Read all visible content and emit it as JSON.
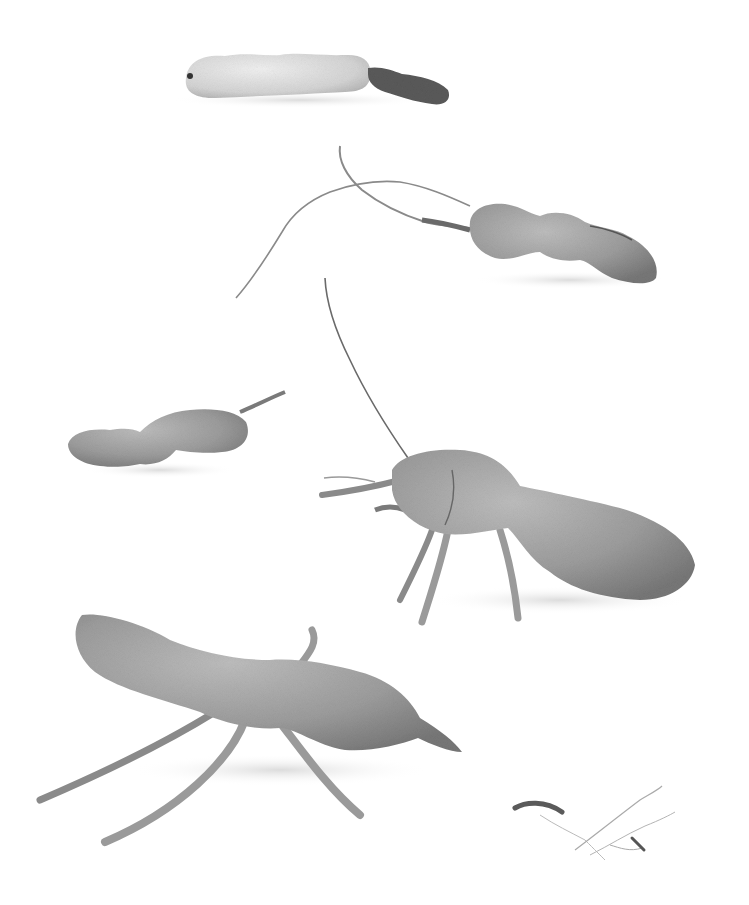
{
  "image": {
    "description": "Black-and-white still-life photograph of dried tamarind pods on a white background, several posed with twig legs and antennae like insects or creatures",
    "background_color": "#ffffff",
    "tone": "grayscale",
    "subjects": [
      {
        "id": "pod-top",
        "label": "pale cracked tamarind pod with dark stem end",
        "position": "top center"
      },
      {
        "id": "pod-three-seed",
        "label": "three-segment pod with long thin stem tendrils",
        "position": "upper right"
      },
      {
        "id": "pod-small",
        "label": "small three-segment pod with short stem",
        "position": "middle left"
      },
      {
        "id": "pod-creature-right",
        "label": "pod creature with four twig legs and a long antenna",
        "position": "middle right"
      },
      {
        "id": "pod-creature-left",
        "label": "large pod creature with twig legs",
        "position": "bottom left"
      },
      {
        "id": "twig-debris",
        "label": "small twig fragment and fine root fibers",
        "position": "bottom right"
      }
    ],
    "colors": {
      "pod_light": "#d6d6d6",
      "pod_mid": "#a8a8a8",
      "pod_dark": "#7c7c7c",
      "stem": "#8a8a8a",
      "stem_dark": "#4a4a4a",
      "shadow": "#e6e6e6"
    }
  }
}
